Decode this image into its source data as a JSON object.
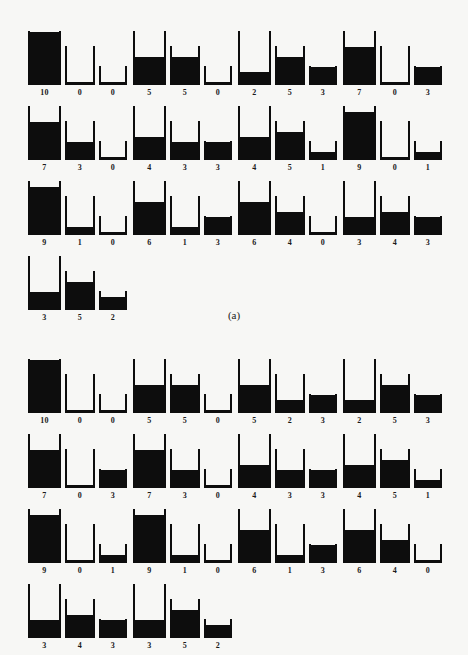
{
  "figure": {
    "jug_capacities": [
      10,
      7,
      3
    ],
    "ink_color": "#0d0d0d",
    "background_color": "#f7f7f5"
  },
  "panels": [
    {
      "id": "a",
      "caption": "(a)",
      "rows": [
        [
          {
            "jugs": [
              {
                "capacity": 10,
                "amount": 10,
                "label": "10"
              },
              {
                "capacity": 7,
                "amount": 0,
                "label": "0"
              },
              {
                "capacity": 3,
                "amount": 0,
                "label": "0"
              }
            ]
          },
          {
            "jugs": [
              {
                "capacity": 10,
                "amount": 5,
                "label": "5"
              },
              {
                "capacity": 7,
                "amount": 5,
                "label": "5"
              },
              {
                "capacity": 3,
                "amount": 0,
                "label": "0"
              }
            ]
          },
          {
            "jugs": [
              {
                "capacity": 10,
                "amount": 2,
                "label": "2"
              },
              {
                "capacity": 7,
                "amount": 5,
                "label": "5"
              },
              {
                "capacity": 3,
                "amount": 3,
                "label": "3"
              }
            ]
          },
          {
            "jugs": [
              {
                "capacity": 10,
                "amount": 7,
                "label": "7"
              },
              {
                "capacity": 7,
                "amount": 0,
                "label": "0"
              },
              {
                "capacity": 3,
                "amount": 3,
                "label": "3"
              }
            ]
          }
        ],
        [
          {
            "jugs": [
              {
                "capacity": 10,
                "amount": 7,
                "label": "7"
              },
              {
                "capacity": 7,
                "amount": 3,
                "label": "3"
              },
              {
                "capacity": 3,
                "amount": 0,
                "label": "0"
              }
            ]
          },
          {
            "jugs": [
              {
                "capacity": 10,
                "amount": 4,
                "label": "4"
              },
              {
                "capacity": 7,
                "amount": 3,
                "label": "3"
              },
              {
                "capacity": 3,
                "amount": 3,
                "label": "3"
              }
            ]
          },
          {
            "jugs": [
              {
                "capacity": 10,
                "amount": 4,
                "label": "4"
              },
              {
                "capacity": 7,
                "amount": 5,
                "label": "5"
              },
              {
                "capacity": 3,
                "amount": 1,
                "label": "1"
              }
            ]
          },
          {
            "jugs": [
              {
                "capacity": 10,
                "amount": 9,
                "label": "9"
              },
              {
                "capacity": 7,
                "amount": 0,
                "label": "0"
              },
              {
                "capacity": 3,
                "amount": 1,
                "label": "1"
              }
            ]
          }
        ],
        [
          {
            "jugs": [
              {
                "capacity": 10,
                "amount": 9,
                "label": "9"
              },
              {
                "capacity": 7,
                "amount": 1,
                "label": "1"
              },
              {
                "capacity": 3,
                "amount": 0,
                "label": "0"
              }
            ]
          },
          {
            "jugs": [
              {
                "capacity": 10,
                "amount": 6,
                "label": "6"
              },
              {
                "capacity": 7,
                "amount": 1,
                "label": "1"
              },
              {
                "capacity": 3,
                "amount": 3,
                "label": "3"
              }
            ]
          },
          {
            "jugs": [
              {
                "capacity": 10,
                "amount": 6,
                "label": "6"
              },
              {
                "capacity": 7,
                "amount": 4,
                "label": "4"
              },
              {
                "capacity": 3,
                "amount": 0,
                "label": "0"
              }
            ]
          },
          {
            "jugs": [
              {
                "capacity": 10,
                "amount": 3,
                "label": "3"
              },
              {
                "capacity": 7,
                "amount": 4,
                "label": "4"
              },
              {
                "capacity": 3,
                "amount": 3,
                "label": "3"
              }
            ]
          }
        ],
        [
          {
            "jugs": [
              {
                "capacity": 10,
                "amount": 3,
                "label": "3"
              },
              {
                "capacity": 7,
                "amount": 5,
                "label": "5"
              },
              {
                "capacity": 3,
                "amount": 2,
                "label": "2"
              }
            ]
          }
        ]
      ]
    },
    {
      "id": "b",
      "caption": "(b)",
      "rows": [
        [
          {
            "jugs": [
              {
                "capacity": 10,
                "amount": 10,
                "label": "10"
              },
              {
                "capacity": 7,
                "amount": 0,
                "label": "0"
              },
              {
                "capacity": 3,
                "amount": 0,
                "label": "0"
              }
            ]
          },
          {
            "jugs": [
              {
                "capacity": 10,
                "amount": 5,
                "label": "5"
              },
              {
                "capacity": 7,
                "amount": 5,
                "label": "5"
              },
              {
                "capacity": 3,
                "amount": 0,
                "label": "0"
              }
            ]
          },
          {
            "jugs": [
              {
                "capacity": 10,
                "amount": 5,
                "label": "5"
              },
              {
                "capacity": 7,
                "amount": 2,
                "label": "2"
              },
              {
                "capacity": 3,
                "amount": 3,
                "label": "3"
              }
            ]
          },
          {
            "jugs": [
              {
                "capacity": 10,
                "amount": 2,
                "label": "2"
              },
              {
                "capacity": 7,
                "amount": 5,
                "label": "5"
              },
              {
                "capacity": 3,
                "amount": 3,
                "label": "3"
              }
            ]
          }
        ],
        [
          {
            "jugs": [
              {
                "capacity": 10,
                "amount": 7,
                "label": "7"
              },
              {
                "capacity": 7,
                "amount": 0,
                "label": "0"
              },
              {
                "capacity": 3,
                "amount": 3,
                "label": "3"
              }
            ]
          },
          {
            "jugs": [
              {
                "capacity": 10,
                "amount": 7,
                "label": "7"
              },
              {
                "capacity": 7,
                "amount": 3,
                "label": "3"
              },
              {
                "capacity": 3,
                "amount": 0,
                "label": "0"
              }
            ]
          },
          {
            "jugs": [
              {
                "capacity": 10,
                "amount": 4,
                "label": "4"
              },
              {
                "capacity": 7,
                "amount": 3,
                "label": "3"
              },
              {
                "capacity": 3,
                "amount": 3,
                "label": "3"
              }
            ]
          },
          {
            "jugs": [
              {
                "capacity": 10,
                "amount": 4,
                "label": "4"
              },
              {
                "capacity": 7,
                "amount": 5,
                "label": "5"
              },
              {
                "capacity": 3,
                "amount": 1,
                "label": "1"
              }
            ]
          }
        ],
        [
          {
            "jugs": [
              {
                "capacity": 10,
                "amount": 9,
                "label": "9"
              },
              {
                "capacity": 7,
                "amount": 0,
                "label": "0"
              },
              {
                "capacity": 3,
                "amount": 1,
                "label": "1"
              }
            ]
          },
          {
            "jugs": [
              {
                "capacity": 10,
                "amount": 9,
                "label": "9"
              },
              {
                "capacity": 7,
                "amount": 1,
                "label": "1"
              },
              {
                "capacity": 3,
                "amount": 0,
                "label": "0"
              }
            ]
          },
          {
            "jugs": [
              {
                "capacity": 10,
                "amount": 6,
                "label": "6"
              },
              {
                "capacity": 7,
                "amount": 1,
                "label": "1"
              },
              {
                "capacity": 3,
                "amount": 3,
                "label": "3"
              }
            ]
          },
          {
            "jugs": [
              {
                "capacity": 10,
                "amount": 6,
                "label": "6"
              },
              {
                "capacity": 7,
                "amount": 4,
                "label": "4"
              },
              {
                "capacity": 3,
                "amount": 0,
                "label": "0"
              }
            ]
          }
        ],
        [
          {
            "jugs": [
              {
                "capacity": 10,
                "amount": 3,
                "label": "3"
              },
              {
                "capacity": 7,
                "amount": 4,
                "label": "4"
              },
              {
                "capacity": 3,
                "amount": 3,
                "label": "3"
              }
            ]
          },
          {
            "jugs": [
              {
                "capacity": 10,
                "amount": 3,
                "label": "3"
              },
              {
                "capacity": 7,
                "amount": 5,
                "label": "5"
              },
              {
                "capacity": 3,
                "amount": 2,
                "label": "2"
              }
            ]
          }
        ]
      ]
    }
  ]
}
